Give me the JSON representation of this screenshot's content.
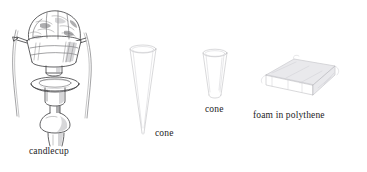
{
  "figure": {
    "background_color": "#ffffff",
    "ink_color": "#3a3a3c",
    "width": 367,
    "height": 172,
    "kind": "line-drawing illustration of packing materials",
    "items": [
      {
        "id": "candlecup",
        "label": "candlecup",
        "description": "candlestick with candlecup wrapped and tied with cord"
      },
      {
        "id": "cone-tall",
        "label": "cone",
        "description": "tall narrow paper cone"
      },
      {
        "id": "cone-short",
        "label": "cone",
        "description": "short wide paper cone"
      },
      {
        "id": "foam",
        "label": "foam in polythene",
        "description": "rectangular foam block sealed in polythene"
      }
    ]
  },
  "captions": {
    "candlecup": "candlecup",
    "cone_tall": "cone",
    "cone_short": "cone",
    "foam": "foam in polythene"
  }
}
